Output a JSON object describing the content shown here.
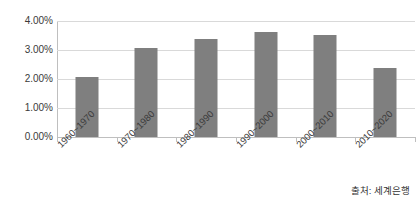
{
  "chart_data": {
    "type": "bar",
    "title": "",
    "xlabel": "",
    "ylabel": "",
    "categories": [
      "1960~1970",
      "1970~1980",
      "1980~1990",
      "1990~2000",
      "2000~2010",
      "2010~2020"
    ],
    "values": [
      2.06,
      3.06,
      3.38,
      3.62,
      3.52,
      2.38
    ],
    "value_unit": "%",
    "ylim": [
      0,
      4
    ],
    "ytick_step": 1,
    "ytick_labels": [
      "0.00%",
      "1.00%",
      "2.00%",
      "3.00%",
      "4.00%"
    ],
    "ytick_values": [
      0,
      1,
      2,
      3,
      4
    ],
    "grid": true,
    "legend": false,
    "series": [
      {
        "name": "",
        "values": [
          2.06,
          3.06,
          3.38,
          3.62,
          3.52,
          2.38
        ]
      }
    ],
    "annotations": {
      "source": "출처: 세계은행"
    },
    "colors": {
      "bar": "#7f7f7f",
      "gridline": "#d9d9d9",
      "axis": "#bfbfbf",
      "text": "#3a3a3a",
      "background": "#ffffff"
    }
  },
  "source_note": "출처: 세계은행"
}
